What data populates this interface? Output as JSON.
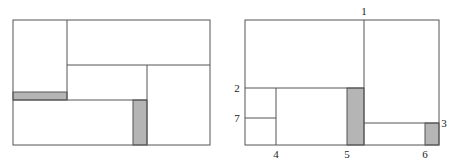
{
  "figure": {
    "left_diagram": {
      "description": "Rectangle partitioned into sub-rectangles with two shaded slivers",
      "outer": {
        "x": 13,
        "y": 20,
        "w": 197,
        "h": 125
      },
      "lines": [
        {
          "x1": 67,
          "y1": 20,
          "x2": 67,
          "y2": 100
        },
        {
          "x1": 67,
          "y1": 65,
          "x2": 210,
          "y2": 65
        },
        {
          "x1": 147,
          "y1": 65,
          "x2": 147,
          "y2": 145
        },
        {
          "x1": 13,
          "y1": 100,
          "x2": 147,
          "y2": 100
        }
      ],
      "shaded": [
        {
          "x": 13,
          "y": 92,
          "w": 54,
          "h": 8
        },
        {
          "x": 133,
          "y": 100,
          "w": 14,
          "h": 45
        }
      ]
    },
    "right_diagram": {
      "description": "Rectangle partitioned with numbered cut points 1-7",
      "outer": {
        "x": 245,
        "y": 20,
        "w": 194,
        "h": 125
      },
      "lines": [
        {
          "x1": 364,
          "y1": 20,
          "x2": 364,
          "y2": 145
        },
        {
          "x1": 245,
          "y1": 88,
          "x2": 364,
          "y2": 88
        },
        {
          "x1": 276,
          "y1": 88,
          "x2": 276,
          "y2": 145
        },
        {
          "x1": 245,
          "y1": 118,
          "x2": 276,
          "y2": 118
        },
        {
          "x1": 364,
          "y1": 123,
          "x2": 439,
          "y2": 123
        }
      ],
      "shaded": [
        {
          "x": 347,
          "y": 88,
          "w": 17,
          "h": 57
        },
        {
          "x": 425,
          "y": 123,
          "w": 14,
          "h": 22
        }
      ],
      "labels": [
        {
          "text": "1",
          "x": 364,
          "y": 15
        },
        {
          "text": "2",
          "x": 237,
          "y": 92
        },
        {
          "text": "3",
          "x": 444,
          "y": 127
        },
        {
          "text": "4",
          "x": 276,
          "y": 158
        },
        {
          "text": "5",
          "x": 347,
          "y": 158
        },
        {
          "text": "6",
          "x": 425,
          "y": 158
        },
        {
          "text": "7",
          "x": 237,
          "y": 122
        }
      ]
    },
    "colors": {
      "line": "#555555",
      "shade": "#b5b5b5",
      "background": "#ffffff"
    }
  }
}
